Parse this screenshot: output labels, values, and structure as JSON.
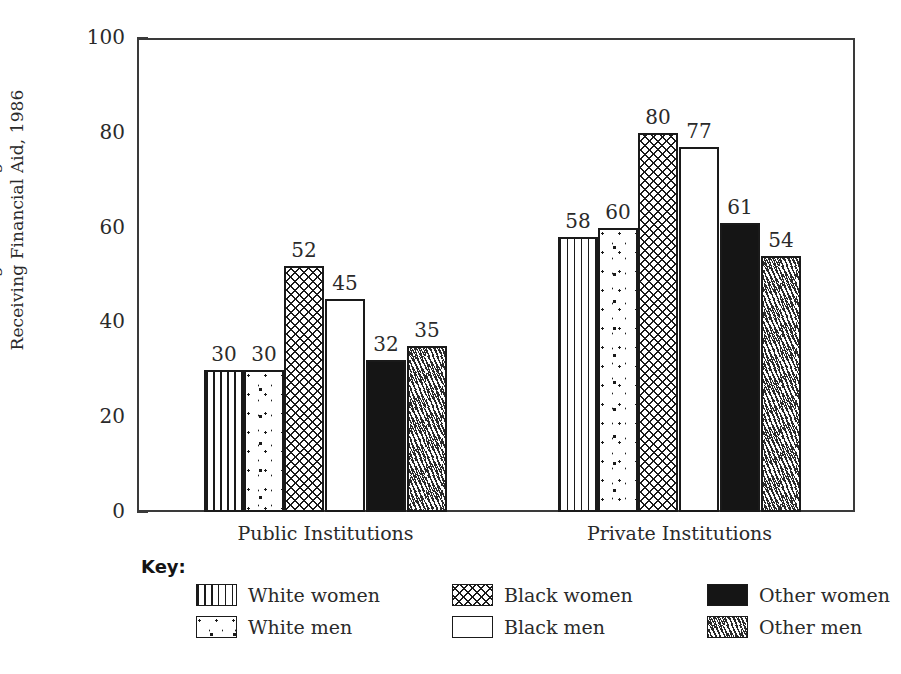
{
  "chart_data": {
    "type": "bar",
    "title": "",
    "subtitle": "",
    "xlabel": "",
    "ylabel": "Percentage of Undergraduates Receiving Financial Aid, 1986",
    "ylabel_lines": [
      "Percentage of Undergraduates",
      "Receiving Financial Aid, 1986"
    ],
    "categories": [
      "Public Institutions",
      "Private Institutions"
    ],
    "ylim": [
      0,
      100
    ],
    "yticks": [
      0,
      20,
      40,
      60,
      80,
      100
    ],
    "ytick_labels": [
      "0",
      "20",
      "40",
      "60",
      "80",
      "100"
    ],
    "grid": false,
    "legend_position": "below",
    "legend_title": "Key:",
    "value_labels_shown": true,
    "series": [
      {
        "name": "White women",
        "pattern": "vertical-lines",
        "values": [
          30,
          58
        ]
      },
      {
        "name": "White men",
        "pattern": "dots",
        "values": [
          30,
          60
        ]
      },
      {
        "name": "Black women",
        "pattern": "cross-hatch",
        "values": [
          52,
          80
        ]
      },
      {
        "name": "Black men",
        "pattern": "empty-white",
        "values": [
          45,
          77
        ]
      },
      {
        "name": "Other women",
        "pattern": "solid-black",
        "values": [
          32,
          61
        ]
      },
      {
        "name": "Other men",
        "pattern": "diagonal-dashes",
        "values": [
          35,
          54
        ]
      }
    ]
  },
  "axis": {
    "y_title_line1": "Percentage of Undergraduates",
    "y_title_line2": "Receiving Financial Aid, 1986",
    "ticks": [
      {
        "label": "100"
      },
      {
        "label": "80"
      },
      {
        "label": "60"
      },
      {
        "label": "40"
      },
      {
        "label": "20"
      },
      {
        "label": "0"
      }
    ]
  },
  "groups": [
    {
      "label": "Public Institutions",
      "bars": [
        {
          "series": "White women",
          "value": 30,
          "value_label": "30"
        },
        {
          "series": "White men",
          "value": 30,
          "value_label": "30"
        },
        {
          "series": "Black women",
          "value": 52,
          "value_label": "52"
        },
        {
          "series": "Black men",
          "value": 45,
          "value_label": "45"
        },
        {
          "series": "Other women",
          "value": 32,
          "value_label": "32"
        },
        {
          "series": "Other men",
          "value": 35,
          "value_label": "35"
        }
      ]
    },
    {
      "label": "Private Institutions",
      "bars": [
        {
          "series": "White women",
          "value": 58,
          "value_label": "58"
        },
        {
          "series": "White men",
          "value": 60,
          "value_label": "60"
        },
        {
          "series": "Black women",
          "value": 80,
          "value_label": "80"
        },
        {
          "series": "Black men",
          "value": 77,
          "value_label": "77"
        },
        {
          "series": "Other women",
          "value": 61,
          "value_label": "61"
        },
        {
          "series": "Other men",
          "value": 54,
          "value_label": "54"
        }
      ]
    }
  ],
  "legend": {
    "title": "Key:",
    "items": [
      {
        "label": "White women",
        "pattern": "vertical-lines"
      },
      {
        "label": "White men",
        "pattern": "dots"
      },
      {
        "label": "Black women",
        "pattern": "cross-hatch"
      },
      {
        "label": "Black men",
        "pattern": "empty-white"
      },
      {
        "label": "Other women",
        "pattern": "solid-black"
      },
      {
        "label": "Other men",
        "pattern": "diagonal-dashes"
      }
    ]
  },
  "colors": {
    "ink": "#1a1a1a",
    "frame": "#3a3a3a",
    "background": "#ffffff",
    "solid_fill": "#151515"
  }
}
